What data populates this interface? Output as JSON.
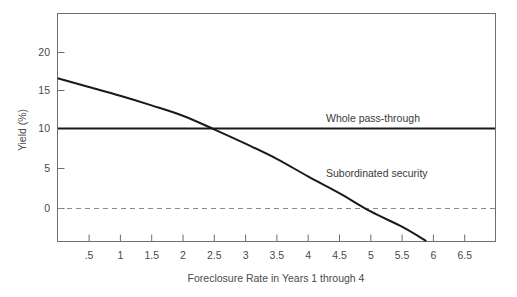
{
  "chart_data": {
    "type": "line",
    "title": "",
    "subtitle": "",
    "xlabel": "Foreclosure Rate in Years 1 through 4",
    "ylabel": "Yield (%)",
    "xlim": [
      0,
      6.75
    ],
    "ylim": [
      -5,
      23
    ],
    "grid": false,
    "legend_position": "inline-annotations",
    "xticks": [
      ".5",
      "1",
      "1.5",
      "2",
      "2.5",
      "3",
      "3.5",
      "4",
      "4.5",
      "5",
      "5.5",
      "6",
      "6.5"
    ],
    "xtick_values": [
      0.5,
      1,
      1.5,
      2,
      2.5,
      3,
      3.5,
      4,
      4.5,
      5,
      5.5,
      6,
      6.5
    ],
    "yticks": [
      "0",
      "5",
      "10",
      "15",
      "20"
    ],
    "ytick_values": [
      0,
      5,
      10,
      15,
      20
    ],
    "reference_lines": [
      {
        "name": "zero-yield",
        "y": 0,
        "style": "dashed",
        "color": "#8a8a8a"
      }
    ],
    "series": [
      {
        "name": "Whole pass-through",
        "label": "Whole pass-through",
        "style": "solid",
        "color": "#1a1a1a",
        "x": [
          0,
          0.5,
          1,
          1.5,
          2,
          2.5,
          3,
          3.5,
          4,
          4.5,
          5,
          5.5,
          6,
          6.75
        ],
        "values": [
          10,
          10,
          10,
          10,
          10,
          10,
          10,
          10,
          10,
          10,
          10,
          10,
          10,
          10
        ],
        "annotation_at": {
          "x": 4.35,
          "y": 11.6
        }
      },
      {
        "name": "Subordinated security",
        "label": "Subordinated security",
        "style": "solid",
        "color": "#1a1a1a",
        "x": [
          0,
          0.5,
          1,
          1.5,
          2,
          2.5,
          3,
          3.5,
          4,
          4.5,
          5,
          5.5,
          6
        ],
        "values": [
          16.3,
          15.2,
          14.1,
          12.9,
          11.6,
          9.9,
          8.1,
          6.2,
          4.0,
          1.9,
          -0.4,
          -2.3,
          -4.6
        ],
        "annotation_at": {
          "x": 4.35,
          "y": 4.9
        }
      }
    ]
  },
  "annotations": {
    "whole_pass_through": "Whole pass-through",
    "subordinated_security": "Subordinated security"
  },
  "axes": {
    "x_title": "Foreclosure Rate in Years 1 through 4",
    "y_title": "Yield (%)"
  }
}
